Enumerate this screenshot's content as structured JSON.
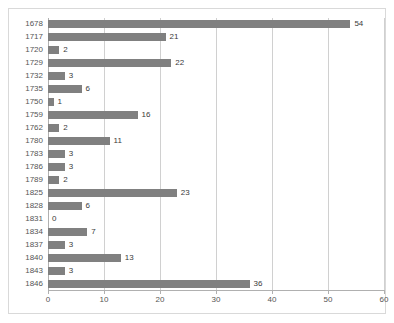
{
  "chart_data": {
    "type": "bar",
    "orientation": "horizontal",
    "title": "",
    "subtitle": "",
    "xlabel": "",
    "ylabel": "",
    "xlim": [
      0,
      60
    ],
    "xticks": [
      0,
      10,
      20,
      30,
      40,
      50,
      60
    ],
    "grid": true,
    "grid_axis": "x",
    "legend": false,
    "legend_position": "none",
    "bar_color": "#808080",
    "grid_color": "#d0d0d0",
    "axis_color": "#b0b0b0",
    "label_color": "#555555",
    "value_label_color": "#3a3a3a",
    "background": "#ffffff",
    "categories": [
      "1678",
      "1717",
      "1720",
      "1729",
      "1732",
      "1735",
      "1750",
      "1759",
      "1762",
      "1780",
      "1783",
      "1786",
      "1789",
      "1825",
      "1828",
      "1831",
      "1834",
      "1837",
      "1840",
      "1843",
      "1846"
    ],
    "values": [
      54,
      21,
      2,
      22,
      3,
      6,
      1,
      16,
      2,
      11,
      3,
      3,
      2,
      23,
      6,
      0,
      7,
      3,
      13,
      3,
      36
    ],
    "value_labels": [
      "54",
      "21",
      "2",
      "22",
      "3",
      "6",
      "1",
      "16",
      "2",
      "11",
      "3",
      "3",
      "2",
      "23",
      "6",
      "0",
      "7",
      "3",
      "13",
      "3",
      "36"
    ],
    "xtick_labels": [
      "0",
      "10",
      "20",
      "30",
      "40",
      "50",
      "60"
    ]
  }
}
